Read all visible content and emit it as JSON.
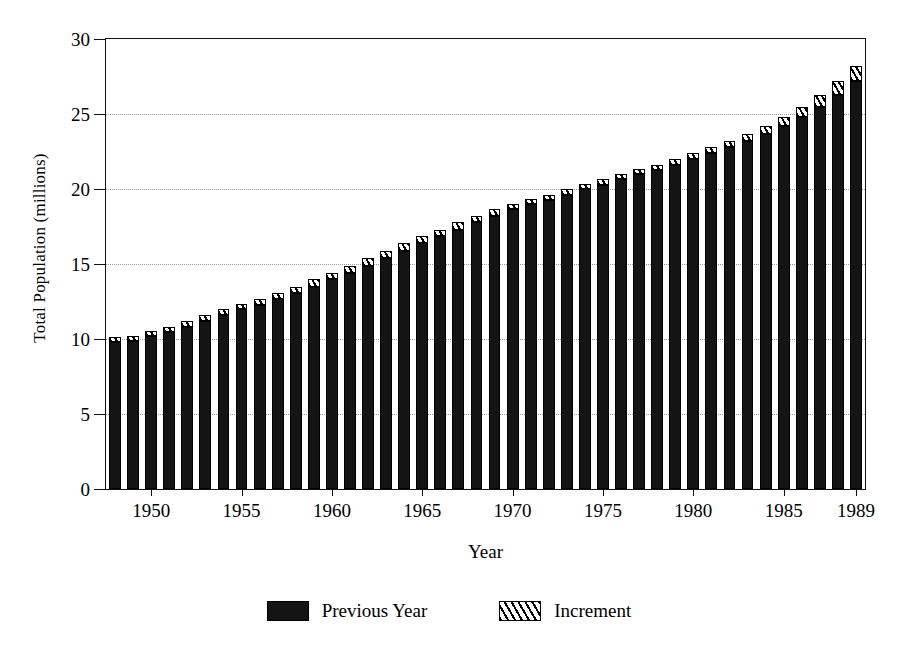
{
  "chart_data": {
    "type": "bar",
    "title": "",
    "xlabel": "Year",
    "ylabel": "Total Population (millions)",
    "ylim": [
      0,
      30
    ],
    "yticks": [
      0,
      5,
      10,
      15,
      20,
      25,
      30
    ],
    "ytick_labels": [
      "0",
      "5",
      "10",
      "15",
      "20",
      "25",
      "30"
    ],
    "xtick_labels": [
      "1950",
      "1955",
      "1960",
      "1965",
      "1970",
      "1975",
      "1980",
      "1985",
      "1989"
    ],
    "xtick_years": [
      1950,
      1955,
      1960,
      1965,
      1970,
      1975,
      1980,
      1985,
      1989
    ],
    "grid": "horizontal-dotted",
    "stacked": true,
    "legend_position": "bottom-center",
    "legend": [
      {
        "name": "Previous Year",
        "style": "solid-black",
        "swatch": "solid"
      },
      {
        "name": "Increment",
        "style": "diagonal-hatch",
        "swatch": "hatch"
      }
    ],
    "categories": [
      1948,
      1949,
      1950,
      1951,
      1952,
      1953,
      1954,
      1955,
      1956,
      1957,
      1958,
      1959,
      1960,
      1961,
      1962,
      1963,
      1964,
      1965,
      1966,
      1967,
      1968,
      1969,
      1970,
      1971,
      1972,
      1973,
      1974,
      1975,
      1976,
      1977,
      1978,
      1979,
      1980,
      1981,
      1982,
      1983,
      1984,
      1985,
      1986,
      1987,
      1988,
      1989
    ],
    "series": [
      {
        "name": "Previous Year",
        "values": [
          9.8,
          9.9,
          10.2,
          10.5,
          10.8,
          11.2,
          11.6,
          12.0,
          12.3,
          12.7,
          13.1,
          13.5,
          14.0,
          14.4,
          14.9,
          15.4,
          15.9,
          16.4,
          16.9,
          17.3,
          17.8,
          18.2,
          18.7,
          19.0,
          19.3,
          19.6,
          20.0,
          20.3,
          20.7,
          21.0,
          21.3,
          21.6,
          22.0,
          22.4,
          22.8,
          23.2,
          23.7,
          24.2,
          24.8,
          25.5,
          26.3,
          27.2
        ]
      },
      {
        "name": "Increment",
        "values": [
          0.2,
          0.3,
          0.3,
          0.3,
          0.4,
          0.4,
          0.4,
          0.3,
          0.4,
          0.4,
          0.4,
          0.5,
          0.4,
          0.5,
          0.5,
          0.5,
          0.5,
          0.5,
          0.4,
          0.5,
          0.4,
          0.5,
          0.3,
          0.3,
          0.3,
          0.4,
          0.3,
          0.4,
          0.3,
          0.3,
          0.3,
          0.4,
          0.4,
          0.4,
          0.4,
          0.5,
          0.5,
          0.6,
          0.7,
          0.8,
          0.9,
          1.0
        ]
      }
    ],
    "totals": [
      10.0,
      10.2,
      10.5,
      10.8,
      11.2,
      11.6,
      12.0,
      12.3,
      12.7,
      13.1,
      13.5,
      14.0,
      14.4,
      14.9,
      15.4,
      15.9,
      16.4,
      16.9,
      17.3,
      17.8,
      18.2,
      18.7,
      19.0,
      19.3,
      19.6,
      20.0,
      20.3,
      20.7,
      21.0,
      21.3,
      21.6,
      22.0,
      22.4,
      22.8,
      23.2,
      23.7,
      24.2,
      24.8,
      25.5,
      26.3,
      27.2,
      28.2
    ]
  }
}
